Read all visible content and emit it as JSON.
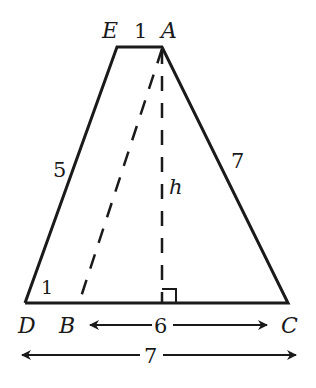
{
  "diagram": {
    "type": "trapezoid-geometry",
    "colors": {
      "stroke": "#1a1a1a",
      "background": "#ffffff"
    },
    "vertices": {
      "E": {
        "label": "E"
      },
      "A": {
        "label": "A"
      },
      "D": {
        "label": "D"
      },
      "B": {
        "label": "B"
      },
      "C": {
        "label": "C"
      }
    },
    "segment_labels": {
      "EA": "1",
      "ED": "5",
      "AC": "7",
      "height": "h",
      "corner_D": "1",
      "BC": "6",
      "DC": "7"
    },
    "annotations": {
      "right_angle": "right-angle marker at foot of altitude from A",
      "dashed_lines": [
        "A to B",
        "A to foot of altitude (h)"
      ]
    }
  }
}
